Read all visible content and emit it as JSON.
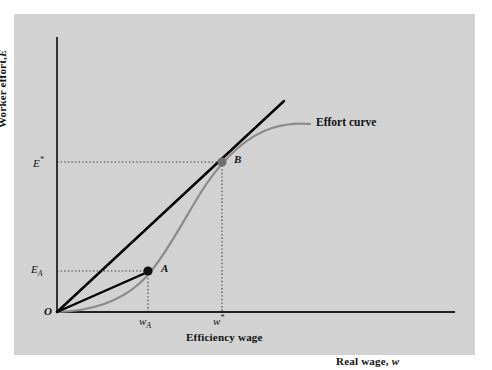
{
  "figure": {
    "type": "diagram",
    "axes": {
      "y_label_text": "Worker effort,",
      "y_label_var": "E",
      "x_label_text": "Efficiency wage",
      "x_axis_far_label_text": "Real wage,",
      "x_axis_far_label_var": "w",
      "origin_label": "O"
    },
    "ticks": {
      "y": [
        {
          "name": "E-star",
          "base": "E",
          "sup": "*",
          "value_px": 162
        },
        {
          "name": "E-A",
          "base": "E",
          "sub": "A",
          "value_px": 271
        }
      ],
      "x": [
        {
          "name": "w-A",
          "base": "w",
          "sub": "A",
          "value_px": 148
        },
        {
          "name": "w-star",
          "base": "w",
          "sup": "*",
          "value_px": 222
        }
      ]
    },
    "series": [
      {
        "name": "effort-curve",
        "label": "Effort curve",
        "color": "#8a8a8a",
        "width": 2.2,
        "path": "M 57 312 C 90 311, 118 303, 140 283 C 163 262, 186 215, 205 186 C 222 161, 244 137, 272 128 C 288 123, 300 123, 310 124"
      },
      {
        "name": "tangent-ray-OB",
        "color": "#000000",
        "width": 2.4,
        "x1": 57,
        "y1": 312,
        "x2": 284,
        "y2": 101
      },
      {
        "name": "chord-ray-OA",
        "color": "#000000",
        "width": 2.4,
        "x1": 57,
        "y1": 312,
        "x2": 150,
        "y2": 271
      }
    ],
    "points": [
      {
        "name": "point-A",
        "label": "A",
        "x": 148,
        "y": 271,
        "r": 4.6,
        "fill": "#111111"
      },
      {
        "name": "point-B",
        "label": "B",
        "x": 222,
        "y": 162,
        "r": 4.6,
        "fill": "#6f6f6f"
      }
    ],
    "leaders": [
      {
        "name": "leader-Estar-horizontal",
        "x1": 57,
        "y1": 162,
        "x2": 222,
        "y2": 162
      },
      {
        "name": "leader-EA-horizontal",
        "x1": 57,
        "y1": 271,
        "x2": 148,
        "y2": 271
      },
      {
        "name": "leader-wA-vertical",
        "x1": 148,
        "y1": 271,
        "x2": 148,
        "y2": 312
      },
      {
        "name": "leader-wstar-vertical",
        "x1": 222,
        "y1": 162,
        "x2": 222,
        "y2": 312
      }
    ],
    "colors": {
      "panel_background": "#d2d2d2",
      "plot_background": "#ffffff",
      "axis": "#222222",
      "curve": "#8a8a8a",
      "line": "#000000",
      "point_a": "#111111",
      "point_b": "#6f6f6f",
      "dotted_leader": "#3a3a3a"
    }
  }
}
